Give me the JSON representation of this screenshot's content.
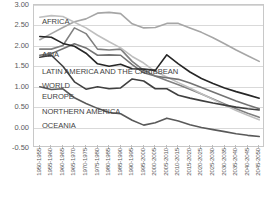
{
  "chart_data": {
    "type": "line",
    "title": "",
    "subtitle": "",
    "xlabel": "",
    "ylabel": "",
    "ylim": [
      -0.5,
      3.0
    ],
    "yticks": [
      "3.00",
      "2.50",
      "2.00",
      "1.50",
      "1.00",
      "0.50",
      "0.00",
      "-0.50"
    ],
    "ytick_values": [
      3.0,
      2.5,
      2.0,
      1.5,
      1.0,
      0.5,
      0.0,
      -0.5
    ],
    "grid": true,
    "legend_position": "inline-left",
    "categories": [
      "1950-1955",
      "1955-1960",
      "1960-1965",
      "1965-1970",
      "1970-1975",
      "1975-1980",
      "1980-1985",
      "1985-1990",
      "1990-1995",
      "1995-2000",
      "2000-2005",
      "2005-2010",
      "2010-2015",
      "2015-2020",
      "2020-2025",
      "2025-2030",
      "2030-2035",
      "2035-2040",
      "2040-2045",
      "2045-2050"
    ],
    "series": [
      {
        "name": "AFRICA",
        "color": "#a6a6a6",
        "values": [
          2.15,
          2.3,
          2.45,
          2.59,
          2.66,
          2.8,
          2.82,
          2.79,
          2.54,
          2.44,
          2.45,
          2.55,
          2.55,
          2.44,
          2.33,
          2.2,
          2.05,
          1.9,
          1.76,
          1.62
        ]
      },
      {
        "name": "ASIA",
        "color": "#808080",
        "values": [
          1.92,
          1.92,
          2.01,
          2.44,
          2.3,
          1.92,
          1.9,
          1.92,
          1.62,
          1.4,
          1.26,
          1.15,
          1.05,
          0.94,
          0.82,
          0.7,
          0.58,
          0.46,
          0.35,
          0.25
        ]
      },
      {
        "name": "LATIN AMERICA AND THE CARIBBEAN",
        "color": "#bfbfbf",
        "values": [
          2.7,
          2.74,
          2.72,
          2.58,
          2.44,
          2.26,
          2.1,
          1.95,
          1.74,
          1.58,
          1.37,
          1.24,
          1.1,
          0.97,
          0.83,
          0.69,
          0.55,
          0.42,
          0.3,
          0.19
        ]
      },
      {
        "name": "WORLD",
        "color": "#737373",
        "values": [
          1.77,
          1.81,
          1.93,
          2.05,
          1.95,
          1.77,
          1.78,
          1.77,
          1.54,
          1.34,
          1.26,
          1.22,
          1.18,
          1.09,
          0.98,
          0.87,
          0.76,
          0.65,
          0.55,
          0.46
        ]
      },
      {
        "name": "EUROPE",
        "color": "#595959",
        "values": [
          1.0,
          0.93,
          0.95,
          0.73,
          0.59,
          0.47,
          0.37,
          0.34,
          0.18,
          0.06,
          0.12,
          0.23,
          0.16,
          0.07,
          0.0,
          -0.05,
          -0.1,
          -0.15,
          -0.19,
          -0.22
        ]
      },
      {
        "name": "NORTHERN AMERICA",
        "color": "#404040",
        "values": [
          1.72,
          1.77,
          1.5,
          1.12,
          0.94,
          1.0,
          0.95,
          0.97,
          1.19,
          1.14,
          0.95,
          0.95,
          0.79,
          0.72,
          0.66,
          0.6,
          0.55,
          0.5,
          0.46,
          0.43
        ]
      },
      {
        "name": "OCEANIA",
        "color": "#262626",
        "values": [
          2.23,
          2.21,
          2.06,
          1.99,
          1.82,
          1.56,
          1.5,
          1.55,
          1.44,
          1.43,
          1.4,
          1.78,
          1.56,
          1.36,
          1.2,
          1.08,
          0.97,
          0.88,
          0.8,
          0.72
        ]
      }
    ],
    "series_label_positions": [
      {
        "name": "AFRICA",
        "x": 8,
        "y": 12
      },
      {
        "name": "ASIA",
        "x": 8,
        "y": 45
      },
      {
        "name": "LATIN AMERICA AND THE CARIBBEAN",
        "x": 8,
        "y": 62
      },
      {
        "name": "WORLD",
        "x": 8,
        "y": 76
      },
      {
        "name": "EUROPE",
        "x": 8,
        "y": 87
      },
      {
        "name": "NORTHERN AMERICA",
        "x": 8,
        "y": 102
      },
      {
        "name": "OCEANIA",
        "x": 8,
        "y": 116
      }
    ]
  }
}
